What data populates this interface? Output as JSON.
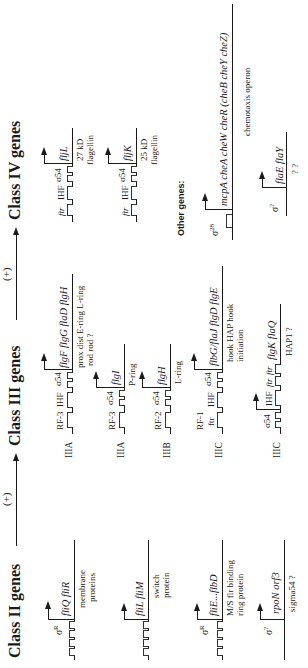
{
  "headers": {
    "class2": "Class II genes",
    "class3": "Class III genes",
    "class4": "Class IV genes",
    "plus1": "(+)",
    "plus2": "(+)",
    "other": "Other genes:"
  },
  "class2": [
    {
      "sigma": "σ",
      "sigma_sup": "R",
      "genes": "fliQ  fliR",
      "products": [
        "membrane",
        "proteins"
      ]
    },
    {
      "sigma": "",
      "sigma_sup": "",
      "genes": "fliL  fliM",
      "products": [
        "switch",
        "protein"
      ]
    },
    {
      "sigma": "σ",
      "sigma_sup": "R",
      "genes": "fliE...flbD",
      "products": [
        "M/S   flr   binding",
        "ring         protein"
      ]
    },
    {
      "sigma": "σ",
      "sigma_sup": "?",
      "genes": "rpoN  orf3",
      "products": [
        "sigma54    ?"
      ]
    }
  ],
  "class3": [
    {
      "subclass": "IIIA",
      "sites": [
        "RF-3",
        "IHF",
        "σ54"
      ],
      "genes": "flgF  flgG  flaD  flgH",
      "products": [
        "prox   dist  E-ring L-ring",
        "rod    rod    ?"
      ]
    },
    {
      "subclass": "IIIA",
      "sites": [
        "RF-3",
        "σ54"
      ],
      "genes": "flgI",
      "products": [
        "P-ring"
      ]
    },
    {
      "subclass": "IIIB",
      "sites": [
        "RF-2",
        "σ54"
      ],
      "genes": "flgH",
      "products": [
        "L-ring"
      ]
    },
    {
      "subclass": "IIIC",
      "sites": [
        "RF-1",
        "ftr",
        "IHF",
        "σ54"
      ],
      "genes": "flbG/flaJ  flgD  flgE",
      "products": [
        "hook          HAP  hook",
        "initiation"
      ]
    },
    {
      "subclass": "IIIC",
      "sites": [
        "σ54",
        "IHF",
        "ftr",
        "ftr"
      ],
      "genes": "flgK  flaQ",
      "products": [
        "HAP1    ?"
      ]
    }
  ],
  "class4": [
    {
      "sites": [
        "ftr",
        "IHF",
        "σ54"
      ],
      "genes": "fljL",
      "products": [
        "27 kD",
        "flagellin"
      ]
    },
    {
      "sites": [
        "ftr",
        "IHF",
        "σ54"
      ],
      "genes": "fljK",
      "products": [
        "25 kD",
        "flagellin"
      ]
    }
  ],
  "other": [
    {
      "sigma": "σ",
      "sigma_sup": "28",
      "genes": "mcpA  cheA  cheW  cheR  (cheB  cheY  cheZ)",
      "products": [
        "chemotaxis operon"
      ]
    },
    {
      "sigma": "σ",
      "sigma_sup": "?",
      "genes": "flaE  flaY",
      "products": [
        "?       ?"
      ]
    }
  ]
}
